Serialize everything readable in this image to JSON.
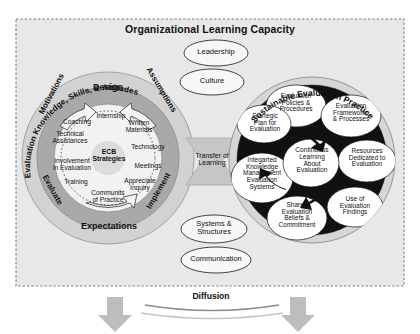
{
  "frame": {
    "title": "Organizational Learning Capacity",
    "background_color": "#e8e8e8",
    "border_color": "#8a8a8a"
  },
  "left_circle": {
    "outer_arc_label": "Evaluation Knowledge, Skills, & Attitudes",
    "ring_labels": [
      "Design",
      "Assumptions",
      "Implement",
      "Expectations",
      "Evaluate",
      "Motivations"
    ],
    "center_label": "ECB\nStrategies",
    "strategies": [
      "Internship",
      "Written\nMaterials",
      "Technology",
      "Meetings",
      "Appreciate\nInquiry",
      "Communits\nof Practice",
      "Training",
      "Involvement\nin Evaluation",
      "Technical\nAssistances",
      "Coaching"
    ],
    "ring_fill": "#a9a9a9",
    "outer_fill": "#d2d2d2",
    "inner_fill": "#f0f0f0"
  },
  "center_column": {
    "items": [
      "Leadership",
      "Culture",
      "Systems &\nStructures",
      "Communication"
    ],
    "transfer_label": "Transfer of\nLearning"
  },
  "right_circle": {
    "outer_arc_label": "Sustainable Evaluation Practice",
    "center_label": "Continuous\nLearning\nAbout\nEvaluation",
    "nodes": [
      "Evaluation\nPolicies &\nProcedures",
      "Evaluation\nFrameworks\n& Processes",
      "Resources\nDedicated to\nEvaluation",
      "Use of\nEvaluation\nFindings",
      "Shared\nEvaluation\nBeliefs &\nCommitment",
      "Integarted\nKnowledge\nManagement\nEvaluation\nSystems",
      "Startegic\nPlan for\nEvaluation"
    ],
    "arrow_color": "#111111",
    "ring_fill": "#c9c9c9"
  },
  "bottom": {
    "diffusion_label": "Diffusion",
    "arrow_color": "#b0b0b0",
    "curve_color": "#9a9a9a"
  }
}
